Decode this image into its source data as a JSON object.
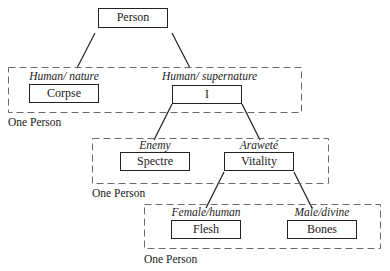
{
  "diagram": {
    "type": "hierarchical-tree",
    "root": {
      "label": "Person"
    },
    "levels": [
      {
        "group_caption": "One Person",
        "nodes": [
          {
            "category": "Human/ nature",
            "label": "Corpse"
          },
          {
            "category": "Human/ supernature",
            "label": "I"
          }
        ]
      },
      {
        "group_caption": "One Person",
        "nodes": [
          {
            "category": "Enemy",
            "label": "Spectre"
          },
          {
            "category": "Araweté",
            "label": "Vitality"
          }
        ]
      },
      {
        "group_caption": "One Person",
        "nodes": [
          {
            "category": "Female/human",
            "label": "Flesh"
          },
          {
            "category": "Male/divine",
            "label": "Bones"
          }
        ]
      }
    ],
    "edges": [
      {
        "from": "Person",
        "to": "Corpse"
      },
      {
        "from": "Person",
        "to": "I"
      },
      {
        "from": "I",
        "to": "Spectre"
      },
      {
        "from": "I",
        "to": "Vitality"
      },
      {
        "from": "Vitality",
        "to": "Flesh"
      },
      {
        "from": "Vitality",
        "to": "Bones"
      }
    ],
    "colors": {
      "line": "#222222",
      "dashed_border": "#6a6a6a",
      "background": "#ffffff"
    }
  }
}
